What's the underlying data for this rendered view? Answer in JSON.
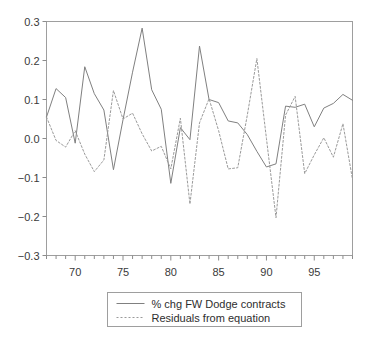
{
  "chart_data": {
    "type": "line",
    "title": "",
    "subtitle": "",
    "xlabel": "",
    "ylabel": "",
    "xlim": [
      1967,
      1999
    ],
    "ylim": [
      -0.3,
      0.3
    ],
    "grid": false,
    "legend_position": "bottom-center",
    "y_ticks": [
      "0.3",
      "0.2",
      "0.1",
      "0.0",
      "−0.1",
      "−0.2",
      "−0.3"
    ],
    "y_tick_values": [
      0.3,
      0.2,
      0.1,
      0.0,
      -0.1,
      -0.2,
      -0.3
    ],
    "x_ticks": [
      "70",
      "75",
      "80",
      "85",
      "90",
      "95"
    ],
    "x_tick_values": [
      1970,
      1975,
      1980,
      1985,
      1990,
      1995
    ],
    "x_minor_tick_step": 1,
    "x": [
      1967,
      1968,
      1969,
      1970,
      1971,
      1972,
      1973,
      1974,
      1975,
      1976,
      1977,
      1978,
      1979,
      1980,
      1981,
      1982,
      1983,
      1984,
      1985,
      1986,
      1987,
      1988,
      1989,
      1990,
      1991,
      1992,
      1993,
      1994,
      1995,
      1996,
      1997,
      1998,
      1999
    ],
    "series": [
      {
        "name": "% chg FW Dodge contracts",
        "style": "solid",
        "color": "#808080",
        "values": [
          0.055,
          0.128,
          0.105,
          -0.012,
          0.184,
          0.115,
          0.073,
          -0.08,
          0.048,
          0.17,
          0.283,
          0.125,
          0.075,
          -0.115,
          0.028,
          -0.003,
          0.237,
          0.1,
          0.092,
          0.045,
          0.04,
          0.01,
          -0.033,
          -0.073,
          -0.065,
          0.083,
          0.08,
          0.088,
          0.03,
          0.078,
          0.09,
          0.113,
          0.098
        ]
      },
      {
        "name": "Residuals from equation",
        "style": "dotted",
        "color": "#9a9a9a",
        "values": [
          0.055,
          -0.005,
          -0.022,
          0.02,
          -0.04,
          -0.085,
          -0.055,
          0.123,
          0.05,
          0.065,
          0.012,
          -0.032,
          -0.02,
          -0.078,
          0.052,
          -0.168,
          0.04,
          0.102,
          0.02,
          -0.078,
          -0.075,
          0.06,
          0.205,
          0.0,
          -0.203,
          0.06,
          0.108,
          -0.09,
          -0.042,
          0.002,
          -0.048,
          0.038,
          -0.105
        ]
      }
    ]
  },
  "legend": {
    "items": [
      {
        "label": "% chg FW Dodge contracts",
        "style": "solid"
      },
      {
        "label": "Residuals from equation",
        "style": "dotted"
      }
    ]
  }
}
